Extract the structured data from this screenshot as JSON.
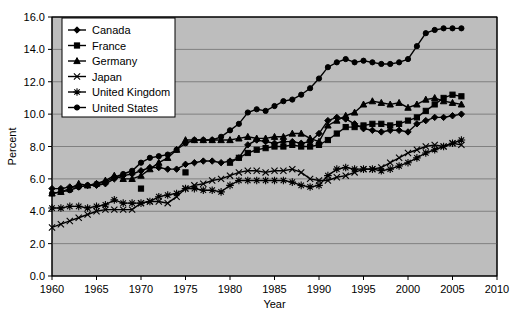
{
  "chart_data": {
    "type": "line",
    "title": "",
    "xlabel": "Year",
    "ylabel": "Percent",
    "xlim": [
      1960,
      2010
    ],
    "ylim": [
      0.0,
      16.0
    ],
    "xticks": [
      1960,
      1965,
      1970,
      1975,
      1980,
      1985,
      1990,
      1995,
      2000,
      2005,
      2010
    ],
    "yticks": [
      "0.0",
      "2.0",
      "4.0",
      "6.0",
      "8.0",
      "10.0",
      "12.0",
      "14.0",
      "16.0"
    ],
    "grid": true,
    "legend_position": "top-left",
    "plot_background": "#bdbdbd",
    "line_color": "#000000",
    "series": [
      {
        "name": "Canada",
        "marker": "diamond",
        "x": [
          1960,
          1961,
          1962,
          1963,
          1964,
          1965,
          1966,
          1967,
          1968,
          1969,
          1970,
          1971,
          1972,
          1973,
          1974,
          1975,
          1976,
          1977,
          1978,
          1979,
          1980,
          1981,
          1982,
          1983,
          1984,
          1985,
          1986,
          1987,
          1988,
          1989,
          1990,
          1991,
          1992,
          1993,
          1994,
          1995,
          1996,
          1997,
          1998,
          1999,
          2000,
          2001,
          2002,
          2003,
          2004,
          2005,
          2006
        ],
        "y": [
          5.4,
          5.4,
          5.5,
          5.5,
          5.6,
          5.6,
          5.7,
          6.0,
          6.2,
          6.3,
          6.5,
          6.7,
          6.7,
          6.6,
          6.6,
          6.9,
          7.0,
          7.1,
          7.1,
          7.0,
          7.1,
          7.3,
          8.1,
          8.4,
          8.3,
          8.2,
          8.3,
          8.3,
          8.2,
          8.3,
          8.8,
          9.6,
          9.8,
          9.7,
          9.4,
          9.1,
          9.0,
          8.9,
          9.0,
          9.0,
          8.9,
          9.4,
          9.6,
          9.8,
          9.8,
          9.9,
          10.0
        ]
      },
      {
        "name": "France",
        "marker": "square",
        "x": [
          1970,
          1975,
          1980,
          1981,
          1982,
          1983,
          1984,
          1985,
          1986,
          1987,
          1988,
          1989,
          1990,
          1991,
          1992,
          1993,
          1994,
          1995,
          1996,
          1997,
          1998,
          1999,
          2000,
          2001,
          2002,
          2003,
          2004,
          2005,
          2006
        ],
        "y": [
          5.4,
          6.4,
          7.0,
          7.3,
          7.6,
          7.8,
          7.9,
          8.0,
          8.0,
          8.1,
          8.0,
          8.0,
          8.1,
          8.4,
          8.8,
          9.2,
          9.2,
          9.3,
          9.4,
          9.4,
          9.3,
          9.4,
          9.6,
          9.8,
          10.2,
          10.6,
          11.0,
          11.2,
          11.1
        ]
      },
      {
        "name": "Germany",
        "marker": "triangle",
        "x": [
          1960,
          1961,
          1962,
          1963,
          1964,
          1965,
          1966,
          1967,
          1968,
          1969,
          1970,
          1971,
          1972,
          1973,
          1974,
          1975,
          1976,
          1977,
          1978,
          1979,
          1980,
          1981,
          1982,
          1983,
          1984,
          1985,
          1986,
          1987,
          1988,
          1989,
          1990,
          1991,
          1992,
          1993,
          1994,
          1995,
          1996,
          1997,
          1998,
          1999,
          2000,
          2001,
          2002,
          2003,
          2004,
          2005,
          2006
        ],
        "y": [
          5.1,
          5.2,
          5.4,
          5.7,
          5.6,
          5.7,
          5.9,
          6.2,
          6.0,
          6.0,
          6.2,
          6.6,
          7.0,
          7.3,
          7.8,
          8.4,
          8.4,
          8.4,
          8.4,
          8.4,
          8.4,
          8.5,
          8.6,
          8.5,
          8.5,
          8.6,
          8.6,
          8.8,
          8.8,
          8.5,
          8.3,
          9.3,
          9.6,
          9.9,
          10.1,
          10.6,
          10.8,
          10.7,
          10.6,
          10.7,
          10.4,
          10.6,
          10.9,
          11.0,
          10.8,
          10.7,
          10.6
        ]
      },
      {
        "name": "Japan",
        "marker": "x",
        "x": [
          1960,
          1961,
          1962,
          1963,
          1964,
          1965,
          1966,
          1967,
          1968,
          1969,
          1970,
          1971,
          1972,
          1973,
          1974,
          1975,
          1976,
          1977,
          1978,
          1979,
          1980,
          1981,
          1982,
          1983,
          1984,
          1985,
          1986,
          1987,
          1988,
          1989,
          1990,
          1991,
          1992,
          1993,
          1994,
          1995,
          1996,
          1997,
          1998,
          1999,
          2000,
          2001,
          2002,
          2003,
          2004,
          2005,
          2006
        ],
        "y": [
          3.0,
          3.2,
          3.4,
          3.6,
          3.8,
          4.0,
          4.1,
          4.1,
          4.1,
          4.1,
          4.5,
          4.6,
          4.6,
          4.5,
          4.9,
          5.4,
          5.6,
          5.7,
          5.9,
          6.0,
          6.2,
          6.4,
          6.5,
          6.5,
          6.4,
          6.5,
          6.5,
          6.6,
          6.4,
          6.0,
          5.9,
          5.9,
          6.1,
          6.2,
          6.4,
          6.6,
          6.6,
          6.7,
          7.0,
          7.3,
          7.6,
          7.8,
          8.0,
          8.1,
          8.0,
          8.2,
          8.1
        ]
      },
      {
        "name": "United Kingdom",
        "marker": "asterisk",
        "x": [
          1960,
          1961,
          1962,
          1963,
          1964,
          1965,
          1966,
          1967,
          1968,
          1969,
          1970,
          1971,
          1972,
          1973,
          1974,
          1975,
          1976,
          1977,
          1978,
          1979,
          1980,
          1981,
          1982,
          1983,
          1984,
          1985,
          1986,
          1987,
          1988,
          1989,
          1990,
          1991,
          1992,
          1993,
          1994,
          1995,
          1996,
          1997,
          1998,
          1999,
          2000,
          2001,
          2002,
          2003,
          2004,
          2005,
          2006
        ],
        "y": [
          4.2,
          4.2,
          4.3,
          4.3,
          4.2,
          4.3,
          4.4,
          4.7,
          4.5,
          4.5,
          4.5,
          4.6,
          4.9,
          5.0,
          5.1,
          5.4,
          5.4,
          5.3,
          5.3,
          5.2,
          5.6,
          5.9,
          5.9,
          5.9,
          5.9,
          5.9,
          5.9,
          5.8,
          5.6,
          5.5,
          5.6,
          6.2,
          6.6,
          6.7,
          6.6,
          6.6,
          6.6,
          6.5,
          6.6,
          6.8,
          7.0,
          7.3,
          7.6,
          7.8,
          8.0,
          8.2,
          8.4
        ]
      },
      {
        "name": "United States",
        "marker": "circle",
        "x": [
          1960,
          1961,
          1962,
          1963,
          1964,
          1965,
          1966,
          1967,
          1968,
          1969,
          1970,
          1971,
          1972,
          1973,
          1974,
          1975,
          1976,
          1977,
          1978,
          1979,
          1980,
          1981,
          1982,
          1983,
          1984,
          1985,
          1986,
          1987,
          1988,
          1989,
          1990,
          1991,
          1992,
          1993,
          1994,
          1995,
          1996,
          1997,
          1998,
          1999,
          2000,
          2001,
          2002,
          2003,
          2004,
          2005,
          2006
        ],
        "y": [
          5.1,
          5.2,
          5.3,
          5.5,
          5.6,
          5.7,
          5.8,
          6.1,
          6.3,
          6.5,
          7.0,
          7.3,
          7.4,
          7.5,
          7.8,
          8.2,
          8.4,
          8.4,
          8.4,
          8.6,
          9.0,
          9.4,
          10.1,
          10.3,
          10.2,
          10.5,
          10.8,
          10.9,
          11.2,
          11.6,
          12.2,
          12.9,
          13.2,
          13.4,
          13.2,
          13.3,
          13.2,
          13.1,
          13.1,
          13.2,
          13.4,
          14.2,
          15.0,
          15.2,
          15.3,
          15.3,
          15.3
        ]
      }
    ]
  }
}
